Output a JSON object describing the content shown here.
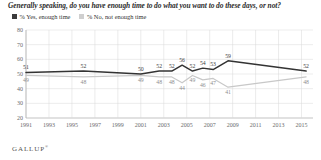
{
  "chart_data": {
    "type": "line",
    "title": "Generally speaking, do you have enough time to do what you want to do these days, or not?",
    "xlabel": "",
    "ylabel": "",
    "ylim": [
      20,
      80
    ],
    "yticks": [
      20,
      30,
      40,
      50,
      60,
      70,
      80
    ],
    "grid": true,
    "legend_position": "top-left",
    "source": "GALLUP",
    "xlim": [
      1991,
      2016
    ],
    "xtick_labels": [
      "1991",
      "1993",
      "1995",
      "1997",
      "1999",
      "2001",
      "2003",
      "2005",
      "2007",
      "2009",
      "2011",
      "2013",
      "2015"
    ],
    "xticks": [
      1991,
      1993,
      1995,
      1997,
      1999,
      2001,
      2003,
      2005,
      2007,
      2009,
      2011,
      2013,
      2015
    ],
    "colors": {
      "yes": "#333333",
      "no": "#c8c8c8"
    },
    "series": [
      {
        "name": "% Yes, enough time",
        "color": "#333333",
        "points": [
          {
            "x": 1991,
            "y": 51,
            "label": "51"
          },
          {
            "x": 1996,
            "y": 52,
            "label": "52"
          },
          {
            "x": 2001,
            "y": 50,
            "label": "50"
          },
          {
            "x": 2002.6,
            "y": 52,
            "label": "52"
          },
          {
            "x": 2003.7,
            "y": 52,
            "label": "52"
          },
          {
            "x": 2004.6,
            "y": 56,
            "label": "56"
          },
          {
            "x": 2005.5,
            "y": 52,
            "label": "52"
          },
          {
            "x": 2006.4,
            "y": 54,
            "label": "54"
          },
          {
            "x": 2007.3,
            "y": 53,
            "label": "53"
          },
          {
            "x": 2008.6,
            "y": 59,
            "label": "59"
          },
          {
            "x": 2015.4,
            "y": 52,
            "label": "52"
          }
        ]
      },
      {
        "name": "% No, not enough time",
        "color": "#c8c8c8",
        "points": [
          {
            "x": 1991,
            "y": 49,
            "label": "49"
          },
          {
            "x": 1996,
            "y": 48,
            "label": "48"
          },
          {
            "x": 2001,
            "y": 49,
            "label": "49"
          },
          {
            "x": 2002.6,
            "y": 48,
            "label": "48"
          },
          {
            "x": 2003.7,
            "y": 48,
            "label": "48"
          },
          {
            "x": 2004.6,
            "y": 44,
            "label": "44"
          },
          {
            "x": 2005.5,
            "y": 49,
            "label": "49"
          },
          {
            "x": 2006.4,
            "y": 46,
            "label": "46"
          },
          {
            "x": 2007.3,
            "y": 47,
            "label": "47"
          },
          {
            "x": 2008.6,
            "y": 41,
            "label": "41"
          },
          {
            "x": 2015.4,
            "y": 48,
            "label": "48"
          }
        ]
      }
    ]
  },
  "legend": {
    "items": [
      {
        "label": "% Yes, enough time",
        "swatch_class": "yes"
      },
      {
        "label": "% No, not enough time",
        "swatch_class": "no"
      }
    ]
  },
  "source": {
    "name": "GALLUP",
    "mark": "®"
  }
}
